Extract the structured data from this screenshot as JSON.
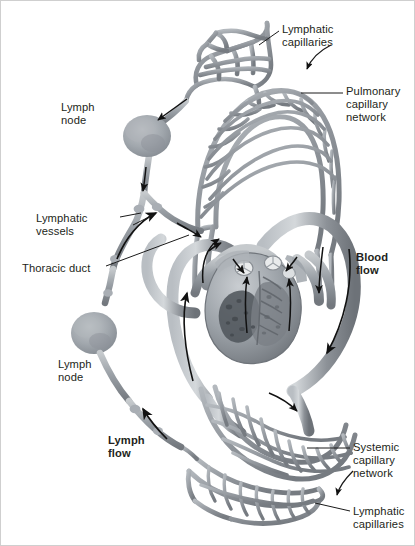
{
  "figure": {
    "background_color": "#ffffff",
    "vessel_color": "#8c9197",
    "vessel_color_dark": "#6d7278",
    "vessel_color_light": "#b9bec3",
    "node_color": "#9aa0a6",
    "text_color": "#231f20",
    "leader_color": "#1a1a1a"
  },
  "labels": [
    {
      "id": "lymphatic-capillaries-top",
      "text": "Lymphatic\ncapillaries",
      "bold": false,
      "x": 281,
      "y": 22
    },
    {
      "id": "pulmonary-capillary-network",
      "text": "Pulmonary\ncapillary\nnetwork",
      "bold": false,
      "x": 345,
      "y": 84
    },
    {
      "id": "lymph-node-upper",
      "text": "Lymph\nnode",
      "bold": false,
      "x": 60,
      "y": 100
    },
    {
      "id": "lymphatic-vessels",
      "text": "Lymphatic\nvessels",
      "bold": false,
      "x": 60,
      "y": 211
    },
    {
      "id": "thoracic-duct",
      "text": "Thoracic duct",
      "bold": false,
      "x": 21,
      "y": 261
    },
    {
      "id": "blood-flow",
      "text": "Blood\nflow",
      "bold": true,
      "x": 355,
      "y": 250
    },
    {
      "id": "lymph-node-lower",
      "text": "Lymph\nnode",
      "bold": false,
      "x": 57,
      "y": 357
    },
    {
      "id": "lymph-flow",
      "text": "Lymph\nflow",
      "bold": true,
      "x": 107,
      "y": 433
    },
    {
      "id": "systemic-capillary-network",
      "text": "Systemic\ncapillary\nnetwork",
      "bold": false,
      "x": 352,
      "y": 440
    },
    {
      "id": "lymphatic-capillaries-bottom",
      "text": "Lymphatic\ncapillaries",
      "bold": false,
      "x": 352,
      "y": 504
    }
  ],
  "structures": [
    {
      "id": "lymphatic-capillary-plexus-top",
      "name": "Lymphatic capillary plexus (upper)"
    },
    {
      "id": "lymph-node-upper-body",
      "name": "Lymph node (upper)"
    },
    {
      "id": "lymphatic-vessel-chain",
      "name": "Lymphatic vessel chain"
    },
    {
      "id": "thoracic-duct-vessel",
      "name": "Thoracic duct"
    },
    {
      "id": "lymph-node-lower-body",
      "name": "Lymph node (lower)"
    },
    {
      "id": "pulmonary-capillary-bed",
      "name": "Pulmonary capillary network"
    },
    {
      "id": "heart-cutaway",
      "name": "Heart, coronal cutaway"
    },
    {
      "id": "pulmonary-arteries",
      "name": "Pulmonary arteries"
    },
    {
      "id": "pulmonary-veins",
      "name": "Pulmonary veins"
    },
    {
      "id": "aorta-arch",
      "name": "Aorta"
    },
    {
      "id": "vena-cava",
      "name": "Venae cavae"
    },
    {
      "id": "systemic-capillary-bed",
      "name": "Systemic capillary network"
    },
    {
      "id": "lymphatic-capillary-plexus-bottom",
      "name": "Lymphatic capillary plexus (lower)"
    }
  ],
  "flow_arrows": [
    {
      "id": "arrow-lymph-into-node-upper",
      "direction": "down-left"
    },
    {
      "id": "arrow-lymph-down-vessel",
      "direction": "down"
    },
    {
      "id": "arrow-thoracic-duct-up",
      "direction": "up-right"
    },
    {
      "id": "arrow-into-vein",
      "direction": "down-right"
    },
    {
      "id": "arrow-lymph-flow-upward",
      "direction": "up-left"
    },
    {
      "id": "arrow-blood-flow-aorta",
      "direction": "down"
    },
    {
      "id": "arrow-pulmonary-artery",
      "direction": "up"
    },
    {
      "id": "arrow-pulmonary-vein",
      "direction": "down"
    },
    {
      "id": "arrow-vena-cava-up",
      "direction": "up"
    },
    {
      "id": "arrow-ventricle-outflow",
      "direction": "up"
    }
  ]
}
